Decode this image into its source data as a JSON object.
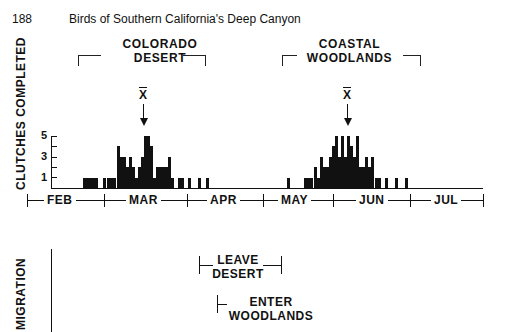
{
  "page": {
    "page_number": "188",
    "running_title": "Birds of Southern California's Deep Canyon"
  },
  "chart_data": {
    "type": "bar",
    "title": "",
    "ylabel": "CLUTCHES COMPLETED",
    "xlabel": "",
    "y_ticks": [
      "1",
      "3",
      "5"
    ],
    "ylim": [
      0,
      5
    ],
    "x_months": [
      "FEB",
      "MAR",
      "APR",
      "MAY",
      "JUN",
      "JUL"
    ],
    "habitats": [
      {
        "label_line1": "COLORADO",
        "label_line2": "DESERT"
      },
      {
        "label_line1": "COASTAL",
        "label_line2": "WOODLANDS"
      }
    ],
    "mean_marker": "X",
    "series": [
      {
        "name": "Colorado Desert",
        "x_px": [
          83,
          86,
          89,
          92,
          95,
          103,
          107,
          110,
          113,
          117,
          120,
          123,
          126,
          129,
          132,
          135,
          138,
          141,
          144,
          147,
          150,
          153,
          156,
          159,
          162,
          165,
          168,
          171,
          178,
          181,
          188,
          198,
          206
        ],
        "values": [
          1,
          1,
          1,
          1,
          1,
          1,
          1,
          1,
          1,
          4,
          3,
          3,
          2,
          3,
          2,
          1,
          2,
          3,
          5,
          5,
          4,
          1,
          2,
          2,
          2,
          2,
          3,
          1,
          1,
          1,
          1,
          1,
          1
        ]
      },
      {
        "name": "Coastal Woodlands",
        "x_px": [
          287,
          304,
          307,
          310,
          314,
          317,
          320,
          323,
          326,
          329,
          332,
          335,
          338,
          341,
          344,
          347,
          350,
          353,
          356,
          359,
          362,
          365,
          368,
          371,
          375,
          378,
          385,
          395,
          405
        ],
        "values": [
          1,
          1,
          1,
          1,
          2,
          1,
          3,
          2,
          2,
          3,
          4,
          5,
          3,
          5,
          3,
          5,
          4,
          3,
          5,
          2,
          2,
          3,
          2,
          3,
          1,
          1,
          1,
          1,
          1
        ]
      }
    ],
    "migration": {
      "row_label": "MIGRATION",
      "events": [
        {
          "label_line1": "LEAVE",
          "label_line2": "DESERT"
        },
        {
          "label_line1": "ENTER",
          "label_line2": "WOODLANDS"
        }
      ]
    }
  }
}
